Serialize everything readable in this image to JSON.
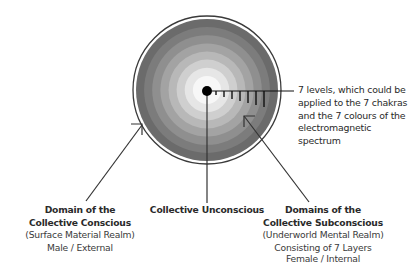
{
  "diagram": {
    "circle": {
      "levels": 7,
      "ring_colors": [
        "#6b6b6b",
        "#7c7c7c",
        "#8f8f8f",
        "#a3a3a3",
        "#b8b8b8",
        "#cfcfcf",
        "#e6e6e6",
        "#f7f7f7"
      ],
      "outline_color": "#3a3a3a",
      "center_dot_color": "#000000"
    },
    "annotation": {
      "lines": [
        "7 levels, which could be",
        "applied to the 7 chakras",
        "and the 7 colours of the",
        "electromagnetic",
        "spectrum"
      ]
    },
    "labels": {
      "conscious": {
        "title_lines": [
          "Domain of the",
          "Collective Conscious"
        ],
        "sub_lines": [
          "(Surface Material Realm)",
          "Male / External"
        ]
      },
      "unconscious": {
        "title_lines": [
          "Collective Unconscious"
        ]
      },
      "subconscious": {
        "title_lines": [
          "Domains of the",
          "Collective Subconscious"
        ],
        "sub_lines": [
          "(Underworld Mental Realm)",
          "Consisting of 7 Layers",
          "Female / Internal"
        ]
      }
    }
  }
}
